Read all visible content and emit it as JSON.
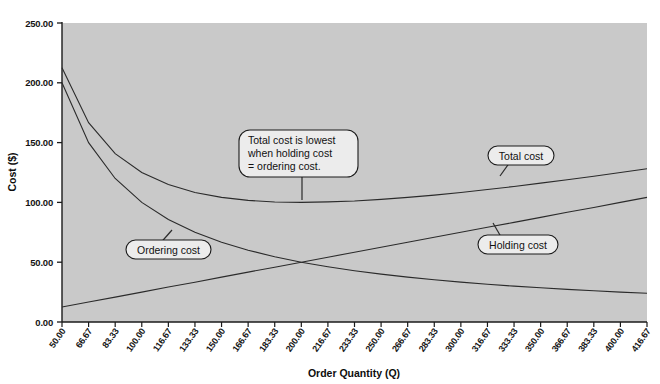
{
  "chart_data": {
    "type": "line",
    "title": "",
    "xlabel": "Order Quantity (Q)",
    "ylabel": "Cost ($)",
    "xlim": [
      50,
      416.67
    ],
    "ylim": [
      0,
      250
    ],
    "grid": false,
    "legend_position": "inline-annotations",
    "x_tick_labels": [
      "50.00",
      "66.67",
      "83.33",
      "100.00",
      "116.67",
      "133.33",
      "150.00",
      "166.67",
      "183.33",
      "200.00",
      "216.67",
      "233.33",
      "250.00",
      "266.67",
      "283.33",
      "300.00",
      "316.67",
      "333.33",
      "350.00",
      "366.67",
      "383.33",
      "400.00",
      "416.67"
    ],
    "y_tick_labels": [
      "0.00",
      "50.00",
      "100.00",
      "150.00",
      "200.00",
      "250.00"
    ],
    "y_tick_values": [
      0,
      50,
      100,
      150,
      200,
      250
    ],
    "series": [
      {
        "name": "Ordering cost",
        "x": [
          50,
          66.67,
          83.33,
          100,
          116.67,
          133.33,
          150,
          166.67,
          183.33,
          200,
          216.67,
          233.33,
          250,
          266.67,
          283.33,
          300,
          316.67,
          333.33,
          350,
          366.67,
          383.33,
          400,
          416.67
        ],
        "values": [
          200,
          150,
          120,
          100,
          85.7,
          75,
          66.7,
          60,
          54.5,
          50,
          46.2,
          42.9,
          40,
          37.5,
          35.3,
          33.3,
          31.6,
          30,
          28.6,
          27.3,
          26.1,
          25,
          24
        ]
      },
      {
        "name": "Holding cost",
        "x": [
          50,
          66.67,
          83.33,
          100,
          116.67,
          133.33,
          150,
          166.67,
          183.33,
          200,
          216.67,
          233.33,
          250,
          266.67,
          283.33,
          300,
          316.67,
          333.33,
          350,
          366.67,
          383.33,
          400,
          416.67
        ],
        "values": [
          12.5,
          16.7,
          20.8,
          25,
          29.2,
          33.3,
          37.5,
          41.7,
          45.8,
          50,
          54.2,
          58.3,
          62.5,
          66.7,
          70.8,
          75,
          79.2,
          83.3,
          87.5,
          91.7,
          95.8,
          100,
          104.2
        ]
      },
      {
        "name": "Total cost",
        "x": [
          50,
          66.67,
          83.33,
          100,
          116.67,
          133.33,
          150,
          166.67,
          183.33,
          200,
          216.67,
          233.33,
          250,
          266.67,
          283.33,
          300,
          316.67,
          333.33,
          350,
          366.67,
          383.33,
          400,
          416.67
        ],
        "values": [
          212.5,
          166.7,
          140.8,
          125,
          114.9,
          108.3,
          104.2,
          101.7,
          100.3,
          100,
          100.4,
          101.2,
          102.5,
          104.2,
          106.1,
          108.3,
          110.8,
          113.3,
          116.1,
          119,
          121.9,
          125,
          128.2
        ]
      }
    ],
    "annotations": [
      {
        "name": "ordering-cost-label",
        "text": "Ordering cost"
      },
      {
        "name": "holding-cost-label",
        "text": "Holding cost"
      },
      {
        "name": "total-cost-label",
        "text": "Total cost"
      },
      {
        "name": "minimum-callout",
        "lines": [
          "Total cost is lowest",
          "when holding cost",
          "= ordering cost."
        ]
      }
    ],
    "colors": {
      "plot_background": "#c9c9c9",
      "page_background": "#ffffff",
      "line": "#2b2b2b",
      "axis": "#1a1a1a",
      "callout_fill": "#ececec",
      "callout_border": "#1a1a1a"
    }
  }
}
